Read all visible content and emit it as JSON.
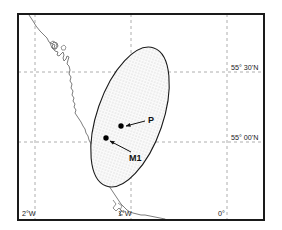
{
  "figure": {
    "type": "map",
    "width": 282,
    "height": 230,
    "background_color": "#ffffff",
    "frame_color": "#1a1a1a",
    "graticule_color": "#9a9a9a",
    "coastline_color": "#666666",
    "ellipse_outline_color": "#1a1a1a",
    "ellipse_fill_color": "#f2f2f2",
    "ellipse_stipple_color": "#8c8c8c",
    "marker_color": "#000000"
  },
  "graticule": {
    "latitude_labels": [
      {
        "id": "lat-55-30",
        "text": "55° 30'N",
        "value_deg": 55.5,
        "y_px": 72
      },
      {
        "id": "lat-55-00",
        "text": "55° 00'N",
        "value_deg": 55.0,
        "y_px": 142
      }
    ],
    "longitude_labels": [
      {
        "id": "lon-2w",
        "text": "2°W",
        "value_deg": -2.0,
        "x_px": 35
      },
      {
        "id": "lon-1w",
        "text": "1°W",
        "value_deg": -1.0,
        "x_px": 131
      },
      {
        "id": "lon-0",
        "text": "0°",
        "value_deg": 0.0,
        "x_px": 227
      }
    ]
  },
  "markers": [
    {
      "id": "marker-p",
      "label": "P",
      "x_px": 121,
      "y_px": 126,
      "label_x_px": 148,
      "label_y_px": 123,
      "leader_from_x": 145,
      "leader_from_y": 121,
      "leader_to_x": 126,
      "leader_to_y": 126
    },
    {
      "id": "marker-m1",
      "label": "M1",
      "x_px": 106,
      "y_px": 138,
      "label_x_px": 129,
      "label_y_px": 157,
      "leader_from_x": 131,
      "leader_from_y": 152,
      "leader_to_x": 110,
      "leader_to_y": 141
    }
  ],
  "ellipse": {
    "id": "uncertainty-ellipse",
    "center_x_px": 130,
    "center_y_px": 117,
    "radius_x_px": 33,
    "radius_y_px": 73,
    "rotation_deg": 19
  }
}
